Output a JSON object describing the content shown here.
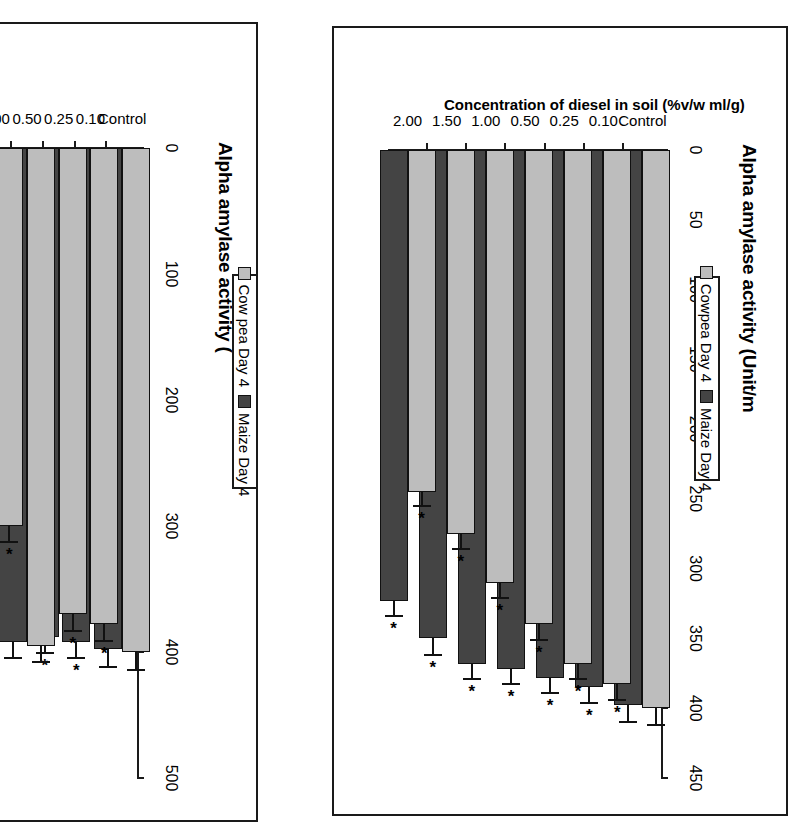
{
  "figure": {
    "panels": [
      {
        "id": "left",
        "value_axis_title": "Alpha amylase activity (",
        "category_axis_title": "",
        "legend": {
          "entries": [
            "Cow pea Day 4",
            "Maize Day 4"
          ]
        }
      },
      {
        "id": "right",
        "value_axis_title": "Alpha amylase activity (Unit/m",
        "category_axis_title": "Concentration of diesel in soil (%v/w ml/g)",
        "legend": {
          "entries": [
            "Cowpea Day 4",
            "Maize Day 4"
          ]
        }
      }
    ],
    "colors": {
      "cowpea": "#bdbdbd",
      "maize": "#444444",
      "axis": "#1a1a1a",
      "background": "#ffffff"
    }
  },
  "chart_data": [
    {
      "type": "bar",
      "orientation": "horizontal",
      "title": "Alpha amylase activity (",
      "xlabel": "Alpha amylase activity (",
      "ylabel": "",
      "xlim": [
        0,
        500
      ],
      "xticks": [
        0,
        100,
        200,
        300,
        400,
        500
      ],
      "ticklabels": [
        "0",
        "100",
        "200",
        "300",
        "400",
        "500"
      ],
      "grid": false,
      "legend_position": "right",
      "categories": [
        "Control",
        "0.10",
        "0.25",
        "0.50",
        "1.00",
        "1.50",
        "2.00"
      ],
      "series": [
        {
          "name": "Cow pea Day 4",
          "color": "#bdbdbd",
          "values": [
            400,
            378,
            370,
            395,
            300,
            268,
            245
          ],
          "errors": [
            14,
            13,
            13,
            13,
            13,
            13,
            13
          ],
          "significance": [
            "",
            "*",
            "*",
            "",
            "*",
            "*",
            "*"
          ]
        },
        {
          "name": "Maize Day 4",
          "color": "#444444",
          "values": [
            398,
            392,
            388,
            392,
            348,
            330,
            300
          ],
          "errors": [
            14,
            13,
            13,
            13,
            13,
            14,
            13
          ],
          "significance": [
            "",
            "*",
            "*",
            "",
            "*",
            "*",
            "*"
          ]
        }
      ]
    },
    {
      "type": "bar",
      "orientation": "horizontal",
      "title": "Alpha amylase activity (Unit/m",
      "xlabel": "Alpha amylase activity (Unit/m",
      "ylabel": "Concentration of diesel in soil (%v/w ml/g)",
      "xlim": [
        0,
        450
      ],
      "xticks": [
        0,
        50,
        100,
        150,
        200,
        250,
        300,
        350,
        400,
        450
      ],
      "ticklabels": [
        "0",
        "50",
        "100",
        "150",
        "200",
        "250",
        "300",
        "350",
        "400",
        "450"
      ],
      "grid": false,
      "legend_position": "right",
      "categories": [
        "Control",
        "0.10",
        "0.25",
        "0.50",
        "1.00",
        "1.50",
        "2.00"
      ],
      "series": [
        {
          "name": "Cowpea Day 4",
          "color": "#bdbdbd",
          "values": [
            400,
            383,
            368,
            340,
            310,
            275,
            245
          ],
          "errors": [
            12,
            11,
            11,
            11,
            11,
            11,
            10
          ],
          "significance": [
            "",
            "*",
            "*",
            "*",
            "*",
            "*",
            "*"
          ]
        },
        {
          "name": "Maize Day 4",
          "color": "#444444",
          "values": [
            398,
            385,
            378,
            372,
            368,
            350,
            323
          ],
          "errors": [
            12,
            11,
            11,
            11,
            11,
            12,
            11
          ],
          "significance": [
            "",
            "*",
            "*",
            "*",
            "*",
            "*",
            "*"
          ]
        }
      ]
    }
  ]
}
